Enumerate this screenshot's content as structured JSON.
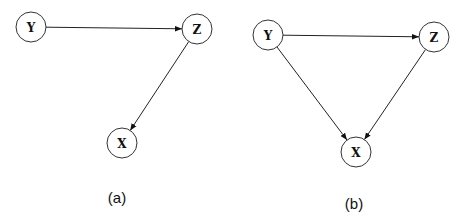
{
  "diagrams": [
    {
      "id": "a",
      "caption": "(a)",
      "caption_pos": [
        117,
        197
      ],
      "nodes": [
        {
          "label": "Y",
          "x": 31,
          "y": 27
        },
        {
          "label": "Z",
          "x": 197,
          "y": 29
        },
        {
          "label": "X",
          "x": 122,
          "y": 143
        }
      ],
      "edges": [
        {
          "from": "Y",
          "to": "Z"
        },
        {
          "from": "Z",
          "to": "X"
        }
      ]
    },
    {
      "id": "b",
      "caption": "(b)",
      "caption_pos": [
        354,
        203
      ],
      "nodes": [
        {
          "label": "Y",
          "x": 268,
          "y": 35
        },
        {
          "label": "Z",
          "x": 434,
          "y": 37
        },
        {
          "label": "X",
          "x": 356,
          "y": 152
        }
      ],
      "edges": [
        {
          "from": "Y",
          "to": "Z"
        },
        {
          "from": "Y",
          "to": "X"
        },
        {
          "from": "Z",
          "to": "X"
        }
      ]
    }
  ],
  "node_radius": 15,
  "colors": {
    "stroke": "#333333",
    "text": "#111111",
    "background": "#ffffff"
  }
}
